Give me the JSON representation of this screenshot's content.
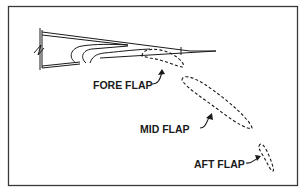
{
  "diagram": {
    "labels": {
      "fore_flap": "FORE FLAP",
      "mid_flap": "MID FLAP",
      "aft_flap": "AFT FLAP"
    },
    "colors": {
      "ink": "#1a1a1a",
      "background": "#ffffff",
      "frame": "#3a3a3a"
    }
  }
}
